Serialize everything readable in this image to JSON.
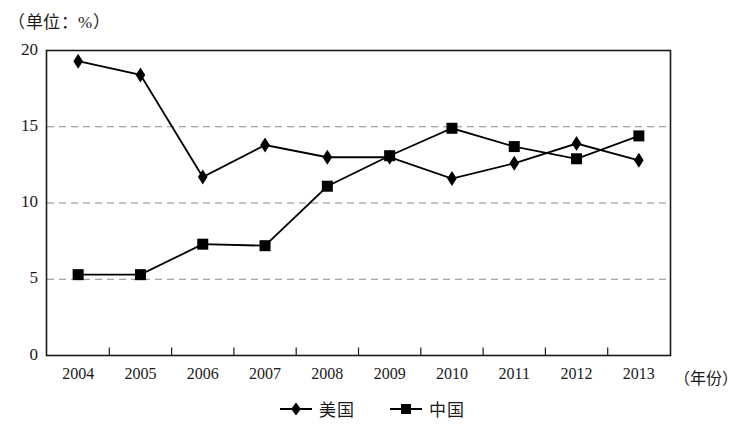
{
  "unit_label": "（单位：%）",
  "axis": {
    "x_title": "（年份）",
    "y_ticks": [
      "0",
      "5",
      "10",
      "15",
      "20"
    ],
    "x_ticks": [
      "2004",
      "2005",
      "2006",
      "2007",
      "2008",
      "2009",
      "2010",
      "2011",
      "2012",
      "2013"
    ]
  },
  "legend": {
    "items": [
      {
        "label": "美国",
        "marker": "diamond-marker",
        "color": "#000000"
      },
      {
        "label": "中国",
        "marker": "square-marker",
        "color": "#000000"
      }
    ]
  },
  "chart_data": {
    "type": "line",
    "title": "",
    "subtitle": "",
    "xlabel": "（年份）",
    "ylabel": "（单位：%）",
    "categories": [
      "2004",
      "2005",
      "2006",
      "2007",
      "2008",
      "2009",
      "2010",
      "2011",
      "2012",
      "2013"
    ],
    "series": [
      {
        "name": "美国",
        "marker": "diamond",
        "color": "#000000",
        "values": [
          19.3,
          18.4,
          11.7,
          13.8,
          13.0,
          13.0,
          11.6,
          12.6,
          13.9,
          12.8
        ]
      },
      {
        "name": "中国",
        "marker": "square",
        "color": "#000000",
        "values": [
          5.3,
          5.3,
          7.3,
          7.2,
          11.1,
          13.1,
          14.9,
          13.7,
          12.9,
          14.4
        ]
      }
    ],
    "ylim": [
      0,
      20
    ],
    "ytick_values": [
      0,
      5,
      10,
      15,
      20
    ],
    "grid": {
      "horizontal_dashed_at": [
        5,
        10,
        15
      ],
      "vertical": false
    },
    "legend_position": "bottom-center"
  }
}
